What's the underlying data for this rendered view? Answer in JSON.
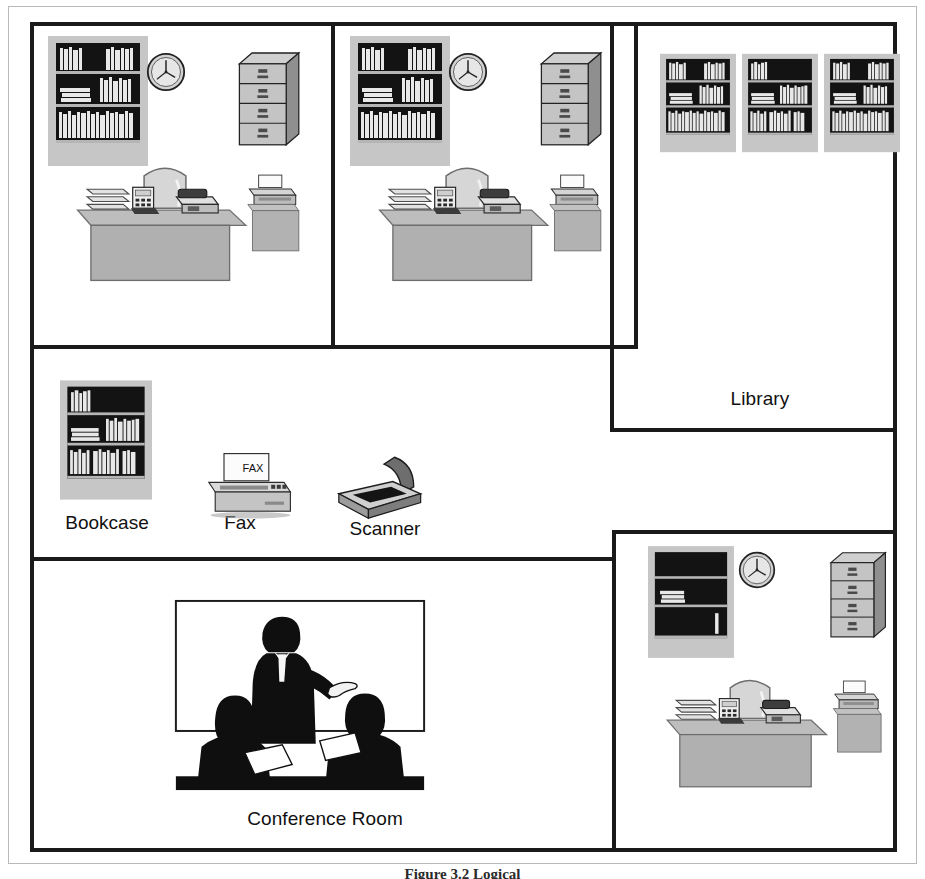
{
  "figure": {
    "caption": "Figure     3.2  Logical"
  },
  "floorplan": {
    "title": "Office Floor Plan",
    "rooms": [
      {
        "id": "office-1",
        "label": "",
        "x": 30,
        "y": 22,
        "w": 303,
        "h": 323
      },
      {
        "id": "office-2",
        "label": "",
        "x": 333,
        "y": 22,
        "w": 305,
        "h": 323
      },
      {
        "id": "library",
        "label": "Library",
        "x": 610,
        "y": 22,
        "w": 285,
        "h": 408,
        "label_x": 700,
        "label_y": 388
      },
      {
        "id": "open-area",
        "label": "",
        "x": 30,
        "y": 345,
        "w": 580,
        "h": 210
      },
      {
        "id": "conference-room",
        "label": "Conference Room",
        "x": 30,
        "y": 557,
        "w": 584,
        "h": 295,
        "label_x": 200,
        "label_y": 812
      },
      {
        "id": "office-3",
        "label": "",
        "x": 614,
        "y": 530,
        "w": 281,
        "h": 322
      }
    ],
    "equipment_labels": [
      {
        "id": "bookcase",
        "text": "Bookcase",
        "x": 58,
        "y": 512
      },
      {
        "id": "fax",
        "text": "Fax",
        "x": 209,
        "y": 512
      },
      {
        "id": "scanner",
        "text": "Scanner",
        "x": 330,
        "y": 518
      }
    ],
    "fax_paper_text": "FAX",
    "icons": {
      "bookcase": "bookcase-icon",
      "clock": "clock-icon",
      "file_cabinet": "file-cabinet-icon",
      "desk": "desk-icon",
      "chair": "chair-icon",
      "telephone": "telephone-icon",
      "paper_tray": "paper-tray-icon",
      "printer": "printer-icon",
      "fax": "fax-machine-icon",
      "scanner": "scanner-icon",
      "presentation": "presentation-meeting-icon"
    },
    "colors": {
      "wall": "#1a1a1a",
      "background": "#ffffff",
      "furniture_light": "#c9c9c9",
      "furniture_mid": "#a8a8a8",
      "furniture_dark": "#7d7d7d",
      "shelf_dark": "#141414",
      "text": "#111111"
    }
  }
}
